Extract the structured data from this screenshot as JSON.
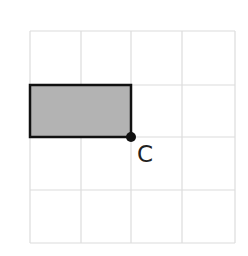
{
  "diagram": {
    "grid": {
      "columns": 4,
      "rows": 4,
      "x_lines": [
        30,
        81,
        131,
        182,
        235
      ],
      "y_lines": [
        31,
        85,
        137,
        190,
        243
      ],
      "line_color": "#dcdcdc"
    },
    "shape": {
      "type": "rectangle",
      "x": 30,
      "y": 85,
      "width": 101,
      "height": 52,
      "fill": "#b3b3b3",
      "stroke": "#111111"
    },
    "point": {
      "name": "C",
      "label": "C",
      "cx": 131,
      "cy": 137,
      "color": "#111111"
    }
  }
}
